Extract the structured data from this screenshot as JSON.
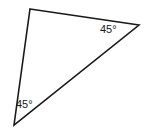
{
  "figure": {
    "type": "geometry-diagram",
    "shape": "triangle",
    "background_color": "#ffffff",
    "stroke_color": "#1a1a1a",
    "stroke_width": 1.6,
    "fill": "none",
    "width": 144,
    "height": 131,
    "vertices": [
      {
        "name": "top",
        "x": 30,
        "y": 9
      },
      {
        "name": "right",
        "x": 139,
        "y": 25
      },
      {
        "name": "bottom-left",
        "x": 14,
        "y": 125
      }
    ],
    "path": "M 30 9 L 139 25 L 14 125 Z",
    "labels": [
      {
        "id": "angle-right",
        "text": "45°",
        "value": 45,
        "unit": "degrees",
        "at_vertex": "right",
        "x": 100,
        "y": 24
      },
      {
        "id": "angle-bottom-left",
        "text": "45°",
        "value": 45,
        "unit": "degrees",
        "at_vertex": "bottom-left",
        "x": 16,
        "y": 99
      }
    ]
  }
}
